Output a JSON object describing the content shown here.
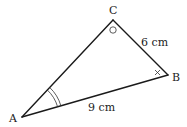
{
  "diagram": {
    "type": "triangle",
    "vertices": {
      "A": {
        "label": "A"
      },
      "B": {
        "label": "B"
      },
      "C": {
        "label": "C"
      }
    },
    "sides": {
      "CB": {
        "label": "6 cm"
      },
      "AB": {
        "label": "9 cm"
      },
      "AC": {
        "label": ""
      }
    },
    "angle_marks": {
      "A": "double-arc",
      "B": "cross",
      "C": "circle"
    },
    "colors": {
      "stroke": "#1a1a1a",
      "background": "#ffffff"
    }
  }
}
